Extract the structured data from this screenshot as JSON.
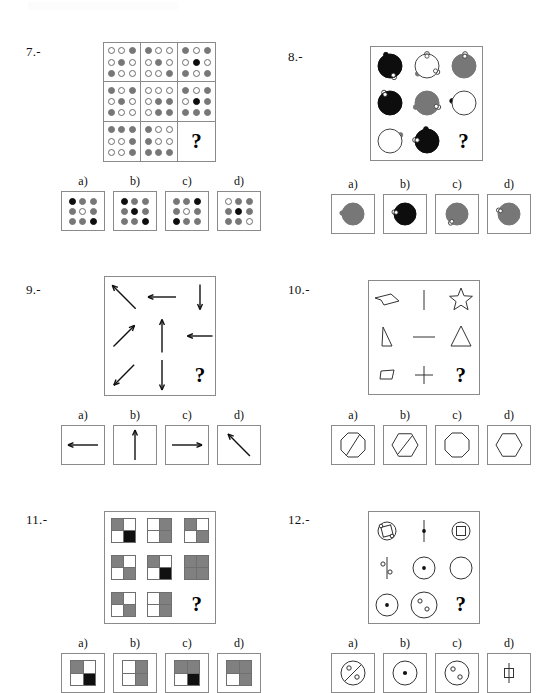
{
  "document": {
    "type": "psychometric-matrix-reasoning-worksheet",
    "page_background": "#ffffff",
    "ink_color": "#111111",
    "grey": "#777777",
    "black": "#0d0d0d",
    "border": "#8a8a8a"
  },
  "option_labels": [
    "a)",
    "b)",
    "c)",
    "d)"
  ],
  "question_mark": "?",
  "questions": [
    {
      "number": "7.-",
      "kind": "dot-grid",
      "matrix": {
        "cells": [
          {
            "dots": [
              "w",
              "w",
              "g",
              "w",
              "g",
              "w",
              "g",
              "w",
              "w"
            ]
          },
          {
            "dots": [
              "g",
              "w",
              "w",
              "w",
              "g",
              "w",
              "w",
              "w",
              "g"
            ]
          },
          {
            "dots": [
              "g",
              "w",
              "g",
              "w",
              "k",
              "w",
              "g",
              "w",
              "g"
            ]
          },
          {
            "dots": [
              "g",
              "w",
              "g",
              "w",
              "g",
              "w",
              "g",
              "w",
              "w"
            ]
          },
          {
            "dots": [
              "w",
              "w",
              "w",
              "w",
              "g",
              "g",
              "w",
              "g",
              "g"
            ]
          },
          {
            "dots": [
              "g",
              "w",
              "g",
              "w",
              "k",
              "g",
              "g",
              "g",
              "g"
            ]
          },
          {
            "dots": [
              "g",
              "g",
              "g",
              "w",
              "w",
              "g",
              "w",
              "w",
              "g"
            ]
          },
          {
            "dots": [
              "g",
              "w",
              "w",
              "g",
              "w",
              "w",
              "g",
              "g",
              "g"
            ]
          },
          {
            "dots": [
              "?"
            ]
          }
        ]
      },
      "options": [
        {
          "label": "a)",
          "dots": [
            "k",
            "g",
            "g",
            "g",
            "w",
            "g",
            "g",
            "g",
            "k"
          ]
        },
        {
          "label": "b)",
          "dots": [
            "k",
            "g",
            "g",
            "g",
            "k",
            "g",
            "g",
            "g",
            "k"
          ]
        },
        {
          "label": "c)",
          "dots": [
            "g",
            "g",
            "k",
            "g",
            "w",
            "g",
            "k",
            "g",
            "g"
          ]
        },
        {
          "label": "d)",
          "dots": [
            "w",
            "g",
            "g",
            "g",
            "k",
            "g",
            "g",
            "g",
            "w"
          ]
        }
      ]
    },
    {
      "number": "8.-",
      "kind": "circles-with-knobs",
      "matrix": {
        "cells": [
          {
            "fill": "black",
            "knobs": [
              {
                "a": 250,
                "type": "black"
              },
              {
                "a": 70,
                "type": "white"
              }
            ]
          },
          {
            "fill": "white",
            "knobs": [
              {
                "a": 270,
                "type": "white"
              },
              {
                "a": 30,
                "type": "white"
              },
              {
                "a": 140,
                "type": "grey"
              }
            ]
          },
          {
            "fill": "grey",
            "knobs": [
              {
                "a": 275,
                "type": "white"
              }
            ]
          },
          {
            "fill": "black",
            "knobs": [
              {
                "a": 240,
                "type": "white"
              }
            ]
          },
          {
            "fill": "grey",
            "knobs": [
              {
                "a": 160,
                "type": "grey"
              },
              {
                "a": 20,
                "type": "white"
              }
            ]
          },
          {
            "fill": "white",
            "knobs": [
              {
                "a": 190,
                "type": "black"
              }
            ]
          },
          {
            "fill": "white",
            "knobs": [
              {
                "a": 330,
                "type": "grey"
              }
            ]
          },
          {
            "fill": "black",
            "knobs": [
              {
                "a": 265,
                "type": "black"
              },
              {
                "a": 185,
                "type": "white"
              }
            ]
          },
          {
            "fill": "question",
            "knobs": []
          }
        ]
      },
      "options": [
        {
          "label": "a)",
          "fill": "grey",
          "knobs": [
            {
              "a": 185,
              "type": "grey"
            }
          ]
        },
        {
          "label": "b)",
          "fill": "black",
          "knobs": [
            {
              "a": 190,
              "type": "white"
            }
          ]
        },
        {
          "label": "c)",
          "fill": "grey",
          "knobs": [
            {
              "a": 125,
              "type": "white"
            }
          ]
        },
        {
          "label": "d)",
          "fill": "grey",
          "knobs": [
            {
              "a": 200,
              "type": "white"
            }
          ]
        }
      ]
    },
    {
      "number": "9.-",
      "kind": "arrows",
      "matrix": {
        "cells": [
          {
            "arrow": "up-left",
            "len": 30
          },
          {
            "arrow": "left",
            "len": 28
          },
          {
            "arrow": "down",
            "len": 25
          },
          {
            "arrow": "up-right",
            "len": 27
          },
          {
            "arrow": "up",
            "len": 33
          },
          {
            "arrow": "left",
            "len": 25
          },
          {
            "arrow": "down-left",
            "len": 26
          },
          {
            "arrow": "down",
            "len": 30
          },
          {
            "arrow": "question",
            "len": 0
          }
        ]
      },
      "options": [
        {
          "label": "a)",
          "arrow": "left",
          "len": 30
        },
        {
          "label": "b)",
          "arrow": "up",
          "len": 30
        },
        {
          "label": "c)",
          "arrow": "right",
          "len": 30
        },
        {
          "label": "d)",
          "arrow": "up-left",
          "len": 28
        }
      ]
    },
    {
      "number": "10.-",
      "kind": "line-shapes",
      "matrix": {
        "cells": [
          {
            "shape": "arrowhead-quad"
          },
          {
            "shape": "vertical-bar"
          },
          {
            "shape": "star-5"
          },
          {
            "shape": "right-triangle-narrow"
          },
          {
            "shape": "horizontal-bar"
          },
          {
            "shape": "triangle"
          },
          {
            "shape": "small-trapezoid"
          },
          {
            "shape": "plus"
          },
          {
            "shape": "question"
          }
        ]
      },
      "options": [
        {
          "label": "a)",
          "shape": "octagon-slashed"
        },
        {
          "label": "b)",
          "shape": "hexagon-slashed"
        },
        {
          "label": "c)",
          "shape": "octagon"
        },
        {
          "label": "d)",
          "shape": "hexagon"
        }
      ]
    },
    {
      "number": "11.-",
      "kind": "quad-squares",
      "matrix": {
        "cells": [
          {
            "quads": [
              "g",
              "w",
              "w",
              "k"
            ]
          },
          {
            "quads": [
              "w",
              "g",
              "w",
              "g"
            ]
          },
          {
            "quads": [
              "g",
              "w",
              "w",
              "g"
            ]
          },
          {
            "quads": [
              "g",
              "w",
              "w",
              "g"
            ]
          },
          {
            "quads": [
              "g",
              "w",
              "w",
              "k"
            ]
          },
          {
            "quads": [
              "g",
              "g",
              "g",
              "g"
            ]
          },
          {
            "quads": [
              "g",
              "w",
              "w",
              "g"
            ]
          },
          {
            "quads": [
              "w",
              "g",
              "w",
              "g"
            ]
          },
          {
            "quads": [
              "?"
            ]
          }
        ]
      },
      "options": [
        {
          "label": "a)",
          "quads": [
            "g",
            "w",
            "w",
            "k"
          ]
        },
        {
          "label": "b)",
          "quads": [
            "w",
            "g",
            "w",
            "g"
          ]
        },
        {
          "label": "c)",
          "quads": [
            "g",
            "g",
            "w",
            "k"
          ]
        },
        {
          "label": "d)",
          "quads": [
            "g",
            "g",
            "w",
            "g"
          ]
        }
      ]
    },
    {
      "number": "12.-",
      "kind": "circles-with-inner",
      "matrix": {
        "cells": [
          {
            "outer": "circle-small",
            "inner": "square-rot"
          },
          {
            "outer": "line-vertical",
            "inner": "dot"
          },
          {
            "outer": "circle-small",
            "inner": "square"
          },
          {
            "outer": "line-vertical",
            "inner": "two-rings"
          },
          {
            "outer": "circle-mid",
            "inner": "dot"
          },
          {
            "outer": "circle-mid",
            "inner": "none"
          },
          {
            "outer": "circle-mid",
            "inner": "dot"
          },
          {
            "outer": "circle-big",
            "inner": "two-rings"
          },
          {
            "outer": "question",
            "inner": "none"
          }
        ]
      },
      "options": [
        {
          "label": "a)",
          "shape": "circle-slash-two-rings"
        },
        {
          "label": "b)",
          "shape": "circle-dot"
        },
        {
          "label": "c)",
          "shape": "circle-two-rings"
        },
        {
          "label": "d)",
          "shape": "small-square-stack"
        }
      ]
    }
  ]
}
